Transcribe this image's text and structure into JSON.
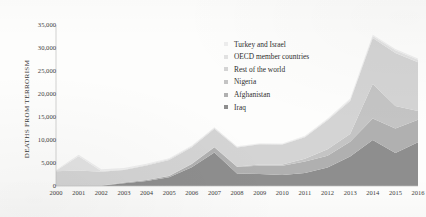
{
  "chart_data": {
    "type": "area",
    "stacked": true,
    "title": "",
    "xlabel": "",
    "ylabel": "DEATHS FROM TERRORISM",
    "grid": false,
    "legend_position": "inside-top-center",
    "ylim": [
      0,
      35000
    ],
    "ytick_labels": [
      "35,000",
      "30,000",
      "25,000",
      "20,000",
      "15,000",
      "10,000",
      "5,000",
      "0"
    ],
    "ytick_values": [
      35000,
      30000,
      25000,
      20000,
      15000,
      10000,
      5000,
      0
    ],
    "categories": [
      "2000",
      "2001",
      "2002",
      "2003",
      "2004",
      "2005",
      "2006",
      "2007",
      "2008",
      "2009",
      "2010",
      "2011",
      "2012",
      "2013",
      "2014",
      "2015",
      "2016"
    ],
    "series": [
      {
        "name": "Iraq",
        "color": "#8e8e8e",
        "marker": "square",
        "values": [
          30,
          40,
          40,
          620,
          1100,
          1900,
          4100,
          7300,
          2700,
          2600,
          2400,
          2800,
          4000,
          6400,
          10000,
          7200,
          9500
        ]
      },
      {
        "name": "Afghanistan",
        "color": "#b0b0b0",
        "marker": "square",
        "values": [
          30,
          30,
          30,
          120,
          200,
          300,
          700,
          1100,
          1500,
          1800,
          2000,
          2500,
          2600,
          3200,
          4700,
          5300,
          4900
        ]
      },
      {
        "name": "Nigeria",
        "color": "#c4c4c4",
        "marker": "square",
        "values": [
          20,
          20,
          20,
          20,
          30,
          30,
          40,
          60,
          60,
          250,
          300,
          600,
          1400,
          1700,
          7500,
          4900,
          1900
        ]
      },
      {
        "name": "Rest of the world",
        "color": "#d4d4d4",
        "marker": "square",
        "values": [
          3100,
          3300,
          3000,
          2700,
          3100,
          3400,
          3600,
          4000,
          4100,
          4400,
          4300,
          4700,
          6300,
          7200,
          10000,
          11500,
          10600
        ]
      },
      {
        "name": "OECD member countries",
        "color": "#e2e2e2",
        "marker": "square",
        "values": [
          120,
          3100,
          150,
          140,
          170,
          230,
          180,
          200,
          180,
          160,
          150,
          170,
          200,
          260,
          400,
          620,
          560
        ]
      },
      {
        "name": "Turkey and Israel",
        "color": "#ededed",
        "marker": "square",
        "values": [
          200,
          280,
          420,
          290,
          260,
          180,
          160,
          130,
          120,
          100,
          110,
          130,
          180,
          240,
          300,
          280,
          250
        ]
      }
    ]
  },
  "axis": {
    "y_title": "DEATHS FROM TERRORISM"
  }
}
